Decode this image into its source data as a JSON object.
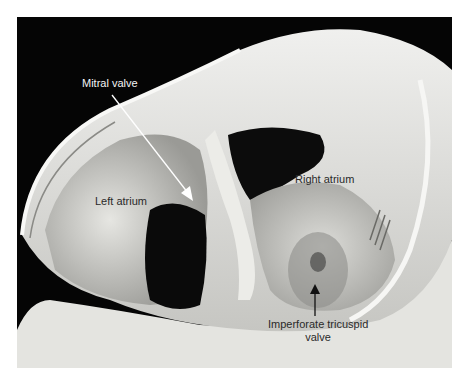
{
  "figure": {
    "labels": {
      "mitral_valve": "Mitral valve",
      "left_atrium": "Left atrium",
      "right_atrium": "Right atrium",
      "tricuspid_line1": "Imperforate tricuspid",
      "tricuspid_line2": "valve"
    },
    "arrows": [
      {
        "name": "mitral-valve-arrow",
        "color": "#ffffff",
        "from": [
          112,
          95
        ],
        "to": [
          193,
          200
        ]
      },
      {
        "name": "tricuspid-valve-arrow",
        "color": "#111111",
        "from": [
          315,
          316
        ],
        "to": [
          315,
          288
        ]
      }
    ],
    "colors": {
      "background": "#050505",
      "tissue_light": "#e8e8e6",
      "tissue_mid": "#b8b8b4",
      "border": "#ffffff"
    }
  }
}
